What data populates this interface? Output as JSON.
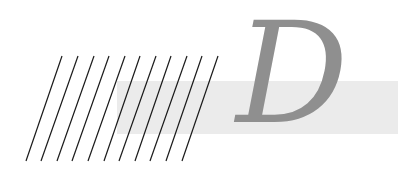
{
  "graphic": {
    "letter": "D",
    "colors": {
      "background": "#ffffff",
      "band": "#ebebeb",
      "letter": "#8f8f8f",
      "lines": "#1a1a1a"
    },
    "band": {
      "x": 117,
      "y": 81,
      "width": 281,
      "height": 53
    },
    "hatch_lines": {
      "count": 11,
      "top_y": 56,
      "bottom_y": 161,
      "top_x": [
        62,
        78,
        94,
        109,
        125,
        140,
        156,
        171,
        187,
        202,
        218
      ],
      "bottom_x": [
        26,
        41,
        57,
        72,
        88,
        104,
        119,
        135,
        150,
        166,
        182
      ]
    }
  }
}
